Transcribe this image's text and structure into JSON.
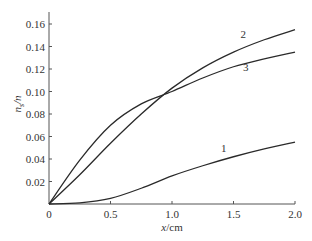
{
  "chart_data": {
    "type": "line",
    "title": "",
    "xlabel": "x/cm",
    "ylabel": "n_s/n",
    "xlim": [
      0,
      2.0
    ],
    "ylim": [
      0,
      0.16
    ],
    "grid": false,
    "legend": "inline curve labels",
    "x_ticks": [
      "0",
      "0.5",
      "1.0",
      "1.5",
      "2.0"
    ],
    "y_ticks": [
      "0.02",
      "0.04",
      "0.06",
      "0.08",
      "0.10",
      "0.12",
      "0.14",
      "0.16"
    ],
    "x": [
      0,
      0.25,
      0.5,
      0.75,
      1.0,
      1.25,
      1.5,
      1.75,
      2.0
    ],
    "series": [
      {
        "name": "1",
        "values": [
          0,
          0.001,
          0.005,
          0.014,
          0.025,
          0.034,
          0.042,
          0.049,
          0.055
        ]
      },
      {
        "name": "2",
        "values": [
          0,
          0.026,
          0.054,
          0.08,
          0.103,
          0.121,
          0.135,
          0.146,
          0.155
        ]
      },
      {
        "name": "3",
        "values": [
          0,
          0.039,
          0.07,
          0.089,
          0.1,
          0.112,
          0.122,
          0.129,
          0.135
        ]
      }
    ],
    "annotations": [
      {
        "text": "1",
        "x": 1.42,
        "y": 0.046
      },
      {
        "text": "2",
        "x": 1.58,
        "y": 0.148
      },
      {
        "text": "3",
        "x": 1.6,
        "y": 0.118
      }
    ]
  },
  "axis": {
    "x_label_var": "x",
    "x_label_unit": "/cm",
    "y_label_var": "n",
    "y_label_sub": "s",
    "y_label_rest": "/n"
  }
}
